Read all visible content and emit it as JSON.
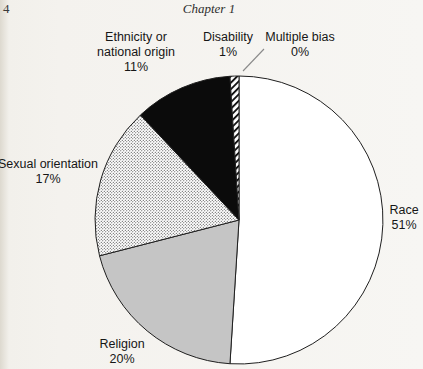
{
  "page": {
    "page_number": "4",
    "running_head": "Chapter 1"
  },
  "chart_data": {
    "type": "pie",
    "categories": [
      "Race",
      "Religion",
      "Sexual orientation",
      "Ethnicity or national origin",
      "Disability",
      "Multiple bias"
    ],
    "values": [
      51,
      20,
      17,
      11,
      1,
      0
    ],
    "unit": "%",
    "start_angle": "top",
    "direction": "clockwise",
    "slice_styles": [
      "white",
      "gray",
      "dots",
      "black",
      "hatch",
      "none"
    ],
    "colors": {
      "white": "#ffffff",
      "gray": "#c5c5c5",
      "black": "#0b0b0b",
      "stroke": "#1f1f1f",
      "leader_line": "#8a8a8a"
    },
    "legend": "none",
    "labels_layout": "outside"
  },
  "slice_labels": {
    "ethnicity": {
      "line1": "Ethnicity or",
      "line2": "national origin",
      "line3": "11%"
    },
    "disability": {
      "line1": "Disability",
      "line2": "1%"
    },
    "multiple_bias": {
      "line1": "Multiple bias",
      "line2": "0%"
    },
    "sexual_orientation": {
      "line1": "Sexual orientation",
      "line2": "17%"
    },
    "religion": {
      "line1": "Religion",
      "line2": "20%"
    },
    "race": {
      "line1": "Race",
      "line2": "51%"
    }
  }
}
